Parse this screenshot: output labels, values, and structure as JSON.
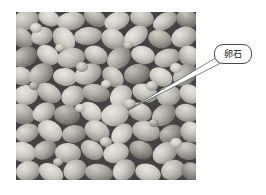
{
  "figure": {
    "type": "annotated-photograph",
    "background_color": "#ffffff",
    "photo": {
      "name": "pebble-aggregate-photo",
      "x": 16,
      "y": 12,
      "width": 180,
      "height": 168,
      "description": "grayscale close-up photograph of rounded pebble aggregate",
      "palette": {
        "shadow": "#2b2b2b",
        "midtone": "#8d8d8d",
        "stone_light": "#d8d8d4",
        "highlight": "#f0efe9"
      }
    },
    "annotations": [
      {
        "name": "pebble-callout",
        "label": "卵石",
        "box": {
          "x": 214,
          "y": 44,
          "width": 38,
          "height": 20,
          "radius": 9
        },
        "line_color": "#4a4a4a",
        "text_color": "#1a1a1a",
        "leader": {
          "from_x": 218,
          "from_y": 63,
          "to_x": 128,
          "to_y": 110
        }
      }
    ]
  }
}
